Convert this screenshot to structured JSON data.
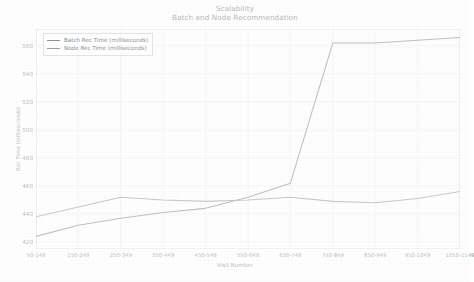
{
  "chart_data": {
    "type": "line",
    "title": "Scalability",
    "subtitle": "Batch and Node Recommendation",
    "xlabel": "Visit Number",
    "ylabel": "Rec Time (milliseconds)",
    "categories": [
      "50-149",
      "150-249",
      "250-349",
      "350-449",
      "450-549",
      "550-649",
      "650-749",
      "750-849",
      "850-949",
      "950-1049",
      "1050-1149"
    ],
    "series": [
      {
        "name": "Batch Rec Time (milliseconds)",
        "color": "#8e9298",
        "values": [
          424,
          432,
          437,
          441,
          444,
          452,
          462,
          562,
          562,
          564,
          566
        ]
      },
      {
        "name": "Node Rec Time (milliseconds)",
        "color": "#9ba0a6",
        "values": [
          438,
          445,
          452,
          450,
          449,
          450,
          452,
          449,
          448,
          451,
          456
        ]
      }
    ],
    "ylim": [
      415,
      572
    ],
    "yticks": [
      420,
      440,
      460,
      480,
      500,
      520,
      540,
      560
    ],
    "grid": true,
    "legend_position": "upper-left"
  },
  "legend": {
    "entries": [
      {
        "label": "Batch Rec Time (milliseconds)"
      },
      {
        "label": "Node Rec Time (milliseconds)"
      }
    ]
  }
}
